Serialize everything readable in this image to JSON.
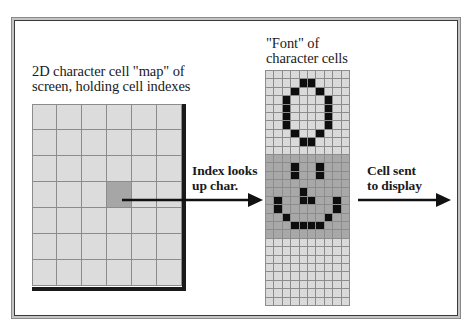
{
  "diagram": {
    "map_label": [
      "2D character cell \"map\" of",
      "screen, holding cell indexes"
    ],
    "font_label": [
      "\"Font\" of",
      "character cells"
    ],
    "lookup_label": [
      "Index looks",
      "up char."
    ],
    "send_label": [
      "Cell sent",
      "to display"
    ],
    "map": {
      "columns": 6,
      "rows": 7,
      "selected_cell": {
        "col": 3,
        "row": 3
      }
    },
    "font": {
      "columns": 10,
      "rows": 28,
      "highlighted_glyph_rows": [
        10,
        19
      ],
      "glyphs": [
        {
          "name": "zero",
          "pixels": [
            [
              1,
              4
            ],
            [
              1,
              5
            ],
            [
              2,
              3
            ],
            [
              2,
              6
            ],
            [
              3,
              2
            ],
            [
              3,
              7
            ],
            [
              4,
              2
            ],
            [
              4,
              7
            ],
            [
              5,
              2
            ],
            [
              5,
              7
            ],
            [
              6,
              2
            ],
            [
              6,
              7
            ],
            [
              7,
              3
            ],
            [
              7,
              6
            ],
            [
              8,
              4
            ],
            [
              8,
              5
            ]
          ]
        },
        {
          "name": "smiley",
          "pixels": [
            [
              11,
              3
            ],
            [
              11,
              6
            ],
            [
              12,
              3
            ],
            [
              12,
              6
            ],
            [
              14,
              4
            ],
            [
              15,
              4
            ],
            [
              15,
              5
            ],
            [
              15,
              1
            ],
            [
              15,
              8
            ],
            [
              16,
              1
            ],
            [
              16,
              8
            ],
            [
              17,
              2
            ],
            [
              17,
              7
            ],
            [
              18,
              3
            ],
            [
              18,
              4
            ],
            [
              18,
              5
            ],
            [
              18,
              6
            ]
          ]
        }
      ]
    },
    "colors": {
      "cell": "#dcdcdc",
      "selected": "#a6a6a6",
      "pixel_on": "#0e0e0e",
      "grid_line": "#8c8c8c",
      "arrow": "#111111"
    }
  }
}
